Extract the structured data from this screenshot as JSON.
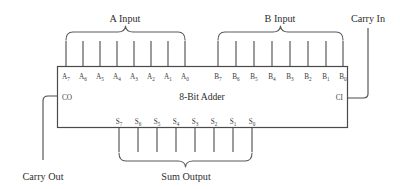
{
  "diagram": {
    "block_label": "8-Bit Adder",
    "colors": {
      "background": "#ffffff",
      "line": "#4a4a4a",
      "brace": "#5a5a5a",
      "text": "#2e2e2e",
      "pin_text": "#3a3a3a"
    },
    "groups": {
      "a_input_label": "A Input",
      "b_input_label": "B Input",
      "sum_output_label": "Sum Output",
      "carry_in_label": "Carry In",
      "carry_out_label": "Carry Out"
    },
    "ports": {
      "carry_out_pin": "CO",
      "carry_in_pin": "CI"
    },
    "a_bits": [
      {
        "base": "A",
        "sub": "7"
      },
      {
        "base": "A",
        "sub": "6"
      },
      {
        "base": "A",
        "sub": "5"
      },
      {
        "base": "A",
        "sub": "4"
      },
      {
        "base": "A",
        "sub": "3"
      },
      {
        "base": "A",
        "sub": "2"
      },
      {
        "base": "A",
        "sub": "1"
      },
      {
        "base": "A",
        "sub": "0"
      }
    ],
    "b_bits": [
      {
        "base": "B",
        "sub": "7"
      },
      {
        "base": "B",
        "sub": "6"
      },
      {
        "base": "B",
        "sub": "5"
      },
      {
        "base": "B",
        "sub": "4"
      },
      {
        "base": "B",
        "sub": "3"
      },
      {
        "base": "B",
        "sub": "2"
      },
      {
        "base": "B",
        "sub": "1"
      },
      {
        "base": "B",
        "sub": "0"
      }
    ],
    "s_bits": [
      {
        "base": "S",
        "sub": "7"
      },
      {
        "base": "S",
        "sub": "6"
      },
      {
        "base": "S",
        "sub": "5"
      },
      {
        "base": "S",
        "sub": "4"
      },
      {
        "base": "S",
        "sub": "3"
      },
      {
        "base": "S",
        "sub": "2"
      },
      {
        "base": "S",
        "sub": "1"
      },
      {
        "base": "S",
        "sub": "0"
      }
    ]
  }
}
